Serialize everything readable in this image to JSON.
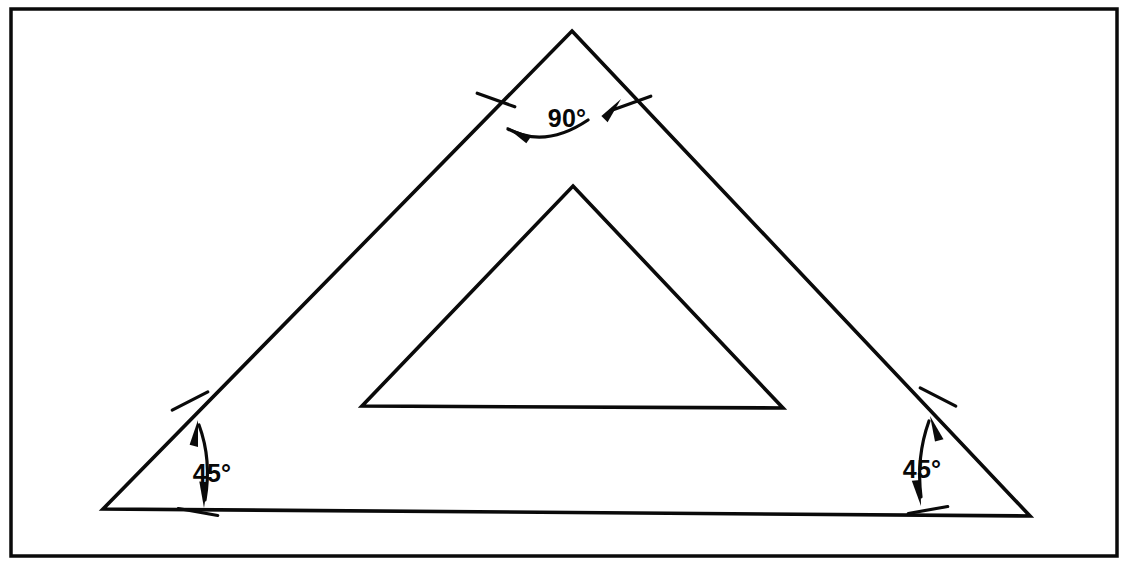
{
  "figure": {
    "background_color": "#ffffff",
    "line_color": "#0a0a0a",
    "frame": {
      "name": "drawing-border",
      "x1": 11,
      "y1": 9,
      "x2": 1117,
      "y2": 556,
      "stroke_width": 3.5
    },
    "outer_triangle": {
      "name": "outer-triangle",
      "apex": {
        "x": 572,
        "y": 31
      },
      "bottom_left": {
        "x": 103,
        "y": 509
      },
      "bottom_right": {
        "x": 1030,
        "y": 516
      },
      "stroke_width": 3.6
    },
    "inner_triangle": {
      "name": "inner-triangle",
      "apex": {
        "x": 573,
        "y": 186
      },
      "bottom_left": {
        "x": 362,
        "y": 406
      },
      "bottom_right": {
        "x": 783,
        "y": 408
      },
      "stroke_width": 3.6
    },
    "angles": [
      {
        "id": "apex",
        "name": "angle-apex",
        "label": "90°",
        "value": 90,
        "unit": "degrees",
        "label_x": 567,
        "label_y": 127,
        "label_anchor": "middle",
        "arc": "M 508,129 Q 545,149 588,120",
        "arrow_left": {
          "x": 506,
          "y": 127,
          "angle": 215
        },
        "arrow_right": {
          "x": 621,
          "y": 99,
          "angle": 315
        },
        "tick_left": {
          "x": 496,
          "y": 100,
          "angle": 20
        },
        "tick_right": {
          "x": 632,
          "y": 103,
          "angle": 160
        }
      },
      {
        "id": "bottom-left",
        "name": "angle-bottom-left",
        "label": "45°",
        "value": 45,
        "unit": "degrees",
        "label_x": 212,
        "label_y": 482,
        "label_anchor": "middle",
        "arc": "M 199,425 Q 212,460 205,500",
        "arrow_top": {
          "x": 198,
          "y": 420,
          "angle": 285
        },
        "arrow_bottom": {
          "x": 204,
          "y": 508,
          "angle": 95
        },
        "tick_top": {
          "x": 190,
          "y": 401,
          "angle": 153
        },
        "tick_bottom": {
          "x": 198,
          "y": 512,
          "angle": 10
        }
      },
      {
        "id": "bottom-right",
        "name": "angle-bottom-right",
        "label": "45°",
        "value": 45,
        "unit": "degrees",
        "label_x": 922,
        "label_y": 478,
        "label_anchor": "middle",
        "arc": "M 929,421 Q 916,457 921,497",
        "arrow_top": {
          "x": 930,
          "y": 416,
          "angle": 255
        },
        "arrow_bottom": {
          "x": 921,
          "y": 506,
          "angle": 85
        },
        "tick_top": {
          "x": 938,
          "y": 397,
          "angle": 27
        },
        "tick_bottom": {
          "x": 928,
          "y": 510,
          "angle": 170
        }
      }
    ]
  }
}
